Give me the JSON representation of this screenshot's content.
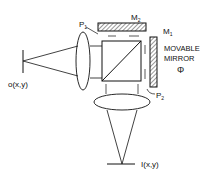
{
  "diagram": {
    "type": "optical-interferometer-schematic",
    "labels": {
      "object_plane": "o(x,y)",
      "image_plane": "I(x,y)",
      "p1": "P",
      "p1_sub": "1",
      "p2": "P",
      "p2_sub": "2",
      "m1": "M",
      "m1_sub": "1",
      "m2": "M",
      "m2_sub": "2",
      "movable_line1": "MOVABLE",
      "movable_line2": "MIRROR",
      "phase_symbol": "Φ"
    },
    "colors": {
      "line": "#111111",
      "hatch": "#555555",
      "background": "#ffffff"
    }
  }
}
